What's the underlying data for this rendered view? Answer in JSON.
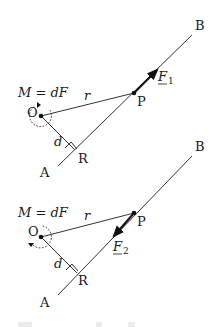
{
  "figure": {
    "panels": [
      {
        "id": "top",
        "moment_label": "M = dF",
        "point_O": "O",
        "point_P": "P",
        "point_R": "R",
        "point_A": "A",
        "point_B": "B",
        "r_label": "r",
        "d_label": "d",
        "force_label_main": "F",
        "force_label_sub": "1",
        "force_direction": "toward B",
        "moment_arrow_direction": "counterclockwise"
      },
      {
        "id": "bottom",
        "moment_label": "M = dF",
        "point_O": "O",
        "point_P": "P",
        "point_R": "R",
        "point_A": "A",
        "point_B": "B",
        "r_label": "r",
        "d_label": "d",
        "force_label_main": "F",
        "force_label_sub": "2",
        "force_direction": "toward A",
        "moment_arrow_direction": "clockwise"
      }
    ],
    "colors": {
      "ink": "#1a1a1a",
      "background": "#ffffff"
    }
  }
}
